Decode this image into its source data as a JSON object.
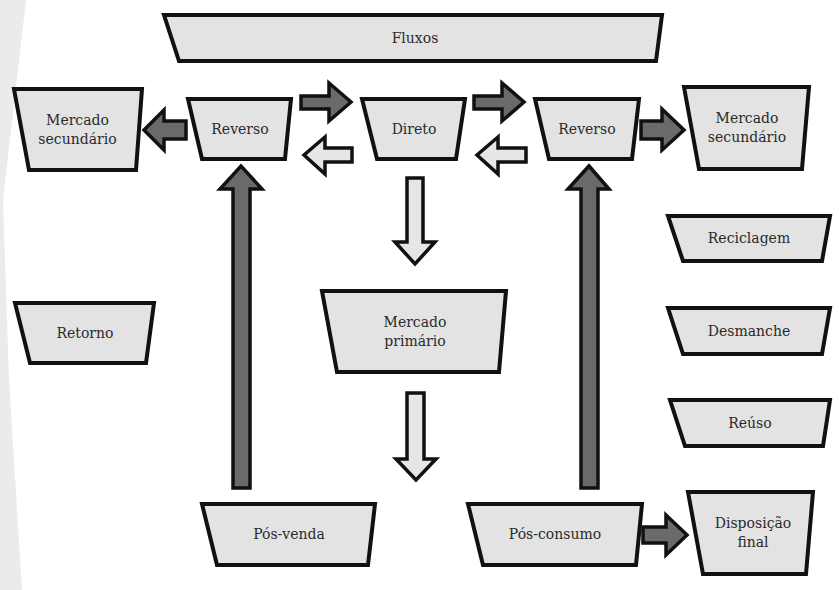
{
  "diagram": {
    "colors": {
      "box_fill": "#e3e3e3",
      "stroke": "#111111",
      "dark_arrow": "#6a6a6a",
      "light_arrow": "#e6e6e6",
      "page_shadow": "#e9e9e9"
    },
    "header": {
      "label": "Fluxos"
    },
    "nodes": {
      "mercado_secundario_left": "Mercado secundário",
      "reverso_left": "Reverso",
      "direto": "Direto",
      "reverso_right": "Reverso",
      "mercado_secundario_right": "Mercado secundário",
      "retorno": "Retorno",
      "mercado_primario": "Mercado primário",
      "reciclagem": "Reciclagem",
      "desmanche": "Desmanche",
      "reuso": "Reúso",
      "pos_venda": "Pós-venda",
      "pos_consumo": "Pós-consumo",
      "disposicao_final": "Disposição final"
    },
    "edges": [
      {
        "from": "Reverso",
        "to": "Mercado secundário",
        "style": "dark",
        "side": "left"
      },
      {
        "from": "Reverso",
        "to": "Direto",
        "style": "dark",
        "side": "left"
      },
      {
        "from": "Direto",
        "to": "Reverso",
        "style": "light",
        "side": "left"
      },
      {
        "from": "Direto",
        "to": "Reverso",
        "style": "dark",
        "side": "right"
      },
      {
        "from": "Reverso",
        "to": "Direto",
        "style": "light",
        "side": "right"
      },
      {
        "from": "Reverso",
        "to": "Mercado secundário",
        "style": "dark",
        "side": "right"
      },
      {
        "from": "Direto",
        "to": "Mercado primário",
        "style": "light"
      },
      {
        "from": "Mercado primário",
        "to": "(down)",
        "style": "light"
      },
      {
        "from": "Pós-venda",
        "to": "Reverso",
        "style": "dark"
      },
      {
        "from": "Pós-consumo",
        "to": "Reverso",
        "style": "dark"
      },
      {
        "from": "Pós-consumo",
        "to": "Disposição final",
        "style": "dark"
      }
    ]
  }
}
